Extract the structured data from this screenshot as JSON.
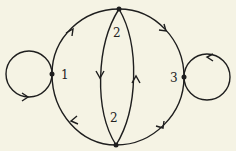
{
  "diagram": {
    "type": "directed multigraph",
    "background": "#f5f3e4",
    "stroke": "#1e1e1e",
    "vertices": [
      {
        "id": "v1",
        "label": "1",
        "x": 52,
        "y": 74
      },
      {
        "id": "v2top",
        "label": "2",
        "x": 119,
        "y": 9
      },
      {
        "id": "v2bottom",
        "label": "2",
        "x": 116,
        "y": 145
      },
      {
        "id": "v3",
        "label": "3",
        "x": 184,
        "y": 77
      }
    ],
    "edges": [
      {
        "from": "v1",
        "to": "v2top",
        "shape": "outer arc"
      },
      {
        "from": "v2top",
        "to": "v3",
        "shape": "outer arc"
      },
      {
        "from": "v3",
        "to": "v2bottom",
        "shape": "outer arc"
      },
      {
        "from": "v2bottom",
        "to": "v1",
        "shape": "outer arc"
      },
      {
        "from": "v2top",
        "to": "v2bottom",
        "shape": "inner left arc"
      },
      {
        "from": "v2bottom",
        "to": "v2top",
        "shape": "inner right arc"
      },
      {
        "from": "v1",
        "to": "v1",
        "shape": "loop left"
      },
      {
        "from": "v3",
        "to": "v3",
        "shape": "loop right"
      }
    ]
  }
}
